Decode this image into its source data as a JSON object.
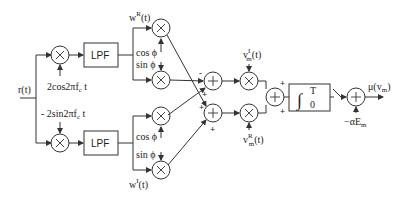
{
  "diagram": {
    "input_label": "r(t)",
    "carriers": {
      "cos": "2cos2πf",
      "cos_sub": "c",
      "cos_t": " t",
      "sin": "- 2sin2πf",
      "sin_sub": "c",
      "sin_t": " t"
    },
    "lpf_top": "LPF",
    "lpf_bottom": "LPF",
    "weights": {
      "top": "w",
      "top_sup": "R",
      "top_t": "(t)",
      "bottom": "w",
      "bottom_sup": "I",
      "bottom_t": "(t)"
    },
    "phase": {
      "cos_top": "cos ϕ",
      "sin_top": "sin ϕ",
      "cos_bottom": "cos ϕ",
      "sin_bottom": "sin ϕ"
    },
    "adder_signs": {
      "a1_left": "-",
      "a1_bottom": "+",
      "a2_left": "+",
      "a2_bottom": "+",
      "sum_top": "+",
      "sum_bottom": "+"
    },
    "references": {
      "top": "v",
      "top_sub": "m",
      "top_sup": "I",
      "top_t": "(t)",
      "bottom": "v",
      "bottom_sub": "m",
      "bottom_sup": "R",
      "bottom_t": "(t)"
    },
    "integrator": {
      "symbol": "∫",
      "upper": "T",
      "lower": "0"
    },
    "bias": "−αE",
    "bias_sub": "m",
    "output": "μ(v",
    "output_sub": "m",
    "output_close": ")",
    "multiplier_glyph": "×",
    "adder_glyph": "+"
  }
}
